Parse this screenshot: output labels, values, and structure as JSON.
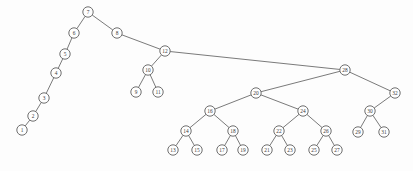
{
  "figure": {
    "width": 413,
    "height": 171,
    "background_color": "#fdfdfd",
    "node_fill_color": "#fefefe",
    "node_stroke_color": "#5f5f5f",
    "edge_color": "#6b6b6b",
    "label_color": "#3a3a3a",
    "node_radius": 5.2
  },
  "chart_data": {
    "type": "diagram",
    "subtype": "binary-search-tree",
    "title": "",
    "root": "7",
    "node_count": 32,
    "nodes": [
      {
        "id": "n1",
        "label": "1",
        "x": 22,
        "y": 130
      },
      {
        "id": "n2",
        "label": "2",
        "x": 33,
        "y": 116
      },
      {
        "id": "n3",
        "label": "3",
        "x": 44,
        "y": 98
      },
      {
        "id": "n4",
        "label": "4",
        "x": 56,
        "y": 73
      },
      {
        "id": "n5",
        "label": "5",
        "x": 65,
        "y": 54
      },
      {
        "id": "n6",
        "label": "6",
        "x": 74,
        "y": 33
      },
      {
        "id": "n7",
        "label": "7",
        "x": 88,
        "y": 12
      },
      {
        "id": "n8",
        "label": "8",
        "x": 117,
        "y": 33
      },
      {
        "id": "n9",
        "label": "9",
        "x": 136,
        "y": 92
      },
      {
        "id": "n10",
        "label": "10",
        "x": 148,
        "y": 70
      },
      {
        "id": "n11",
        "label": "11",
        "x": 158,
        "y": 92
      },
      {
        "id": "n12",
        "label": "12",
        "x": 165,
        "y": 51
      },
      {
        "id": "n13",
        "label": "13",
        "x": 173,
        "y": 150
      },
      {
        "id": "n14",
        "label": "14",
        "x": 186,
        "y": 131
      },
      {
        "id": "n15",
        "label": "15",
        "x": 197,
        "y": 150
      },
      {
        "id": "n16",
        "label": "16",
        "x": 210,
        "y": 111
      },
      {
        "id": "n17",
        "label": "17",
        "x": 222,
        "y": 150
      },
      {
        "id": "n18",
        "label": "18",
        "x": 233,
        "y": 131
      },
      {
        "id": "n19",
        "label": "19",
        "x": 243,
        "y": 150
      },
      {
        "id": "n20",
        "label": "20",
        "x": 256,
        "y": 93
      },
      {
        "id": "n21",
        "label": "21",
        "x": 267,
        "y": 150
      },
      {
        "id": "n22",
        "label": "22",
        "x": 279,
        "y": 131
      },
      {
        "id": "n23",
        "label": "23",
        "x": 290,
        "y": 150
      },
      {
        "id": "n24",
        "label": "24",
        "x": 303,
        "y": 111
      },
      {
        "id": "n25",
        "label": "25",
        "x": 314,
        "y": 150
      },
      {
        "id": "n26",
        "label": "26",
        "x": 326,
        "y": 131
      },
      {
        "id": "n27",
        "label": "27",
        "x": 337,
        "y": 150
      },
      {
        "id": "n28",
        "label": "28",
        "x": 345,
        "y": 70
      },
      {
        "id": "n29",
        "label": "29",
        "x": 358,
        "y": 132
      },
      {
        "id": "n30",
        "label": "30",
        "x": 370,
        "y": 111
      },
      {
        "id": "n31",
        "label": "31",
        "x": 384,
        "y": 132
      },
      {
        "id": "n32",
        "label": "32",
        "x": 395,
        "y": 93
      }
    ],
    "edges": [
      {
        "from": "n7",
        "to": "n6"
      },
      {
        "from": "n6",
        "to": "n5"
      },
      {
        "from": "n5",
        "to": "n4"
      },
      {
        "from": "n4",
        "to": "n3"
      },
      {
        "from": "n3",
        "to": "n2"
      },
      {
        "from": "n2",
        "to": "n1"
      },
      {
        "from": "n7",
        "to": "n8"
      },
      {
        "from": "n8",
        "to": "n12"
      },
      {
        "from": "n12",
        "to": "n10"
      },
      {
        "from": "n10",
        "to": "n9"
      },
      {
        "from": "n10",
        "to": "n11"
      },
      {
        "from": "n12",
        "to": "n28"
      },
      {
        "from": "n28",
        "to": "n20"
      },
      {
        "from": "n20",
        "to": "n16"
      },
      {
        "from": "n16",
        "to": "n14"
      },
      {
        "from": "n14",
        "to": "n13"
      },
      {
        "from": "n14",
        "to": "n15"
      },
      {
        "from": "n16",
        "to": "n18"
      },
      {
        "from": "n18",
        "to": "n17"
      },
      {
        "from": "n18",
        "to": "n19"
      },
      {
        "from": "n20",
        "to": "n24"
      },
      {
        "from": "n24",
        "to": "n22"
      },
      {
        "from": "n22",
        "to": "n21"
      },
      {
        "from": "n22",
        "to": "n23"
      },
      {
        "from": "n24",
        "to": "n26"
      },
      {
        "from": "n26",
        "to": "n25"
      },
      {
        "from": "n26",
        "to": "n27"
      },
      {
        "from": "n28",
        "to": "n32"
      },
      {
        "from": "n32",
        "to": "n30"
      },
      {
        "from": "n30",
        "to": "n29"
      },
      {
        "from": "n30",
        "to": "n31"
      }
    ]
  }
}
